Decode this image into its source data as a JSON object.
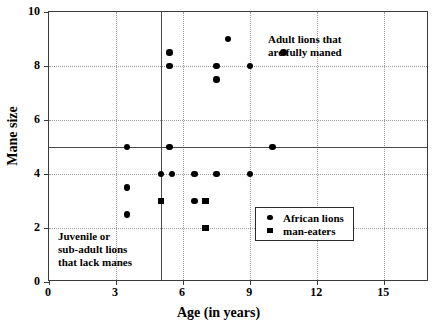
{
  "chart_data": {
    "type": "scatter",
    "title": "",
    "xlabel": "Age (in years)",
    "ylabel": "Mane size",
    "xlim": [
      0,
      17
    ],
    "ylim": [
      0,
      10
    ],
    "grid": true,
    "xticks": [
      0,
      3,
      6,
      9,
      12,
      15
    ],
    "yticks": [
      0,
      2,
      4,
      6,
      8,
      10
    ],
    "xticklabels": [
      "0",
      "3",
      "6",
      "9",
      "12",
      "15"
    ],
    "yticklabels": [
      "0",
      "2",
      "4",
      "6",
      "8",
      "10"
    ],
    "legend_position": "lower right",
    "reference_lines": [
      {
        "axis": "y",
        "value": 5
      },
      {
        "axis": "x",
        "value": 5
      }
    ],
    "series": [
      {
        "name": "African lions",
        "marker": "circle",
        "color": "#000000",
        "points": [
          {
            "x": 3.5,
            "y": 5.0
          },
          {
            "x": 3.5,
            "y": 3.5
          },
          {
            "x": 3.5,
            "y": 2.5
          },
          {
            "x": 5.0,
            "y": 4.0
          },
          {
            "x": 5.4,
            "y": 8.5
          },
          {
            "x": 5.4,
            "y": 8.0
          },
          {
            "x": 5.4,
            "y": 5.0
          },
          {
            "x": 5.5,
            "y": 4.0
          },
          {
            "x": 6.5,
            "y": 4.0
          },
          {
            "x": 6.5,
            "y": 3.0
          },
          {
            "x": 7.5,
            "y": 8.0
          },
          {
            "x": 7.5,
            "y": 7.5
          },
          {
            "x": 7.5,
            "y": 4.0
          },
          {
            "x": 8.0,
            "y": 9.0
          },
          {
            "x": 9.0,
            "y": 8.0
          },
          {
            "x": 9.0,
            "y": 4.0
          },
          {
            "x": 10.0,
            "y": 5.0
          },
          {
            "x": 10.5,
            "y": 8.5
          }
        ]
      },
      {
        "name": "man-eaters",
        "marker": "square",
        "color": "#000000",
        "points": [
          {
            "x": 5.0,
            "y": 3.0
          },
          {
            "x": 7.0,
            "y": 3.0
          },
          {
            "x": 7.0,
            "y": 2.0
          }
        ]
      }
    ],
    "annotations": [
      {
        "id": "adult",
        "text": "Adult lions that\nare fully maned",
        "x": 12.0,
        "y": 8.8
      },
      {
        "id": "juvenile",
        "text": "Juvenile or\nsub-adult lions\nthat lack manes",
        "x": 0.5,
        "y": 1.9
      }
    ]
  },
  "legend": {
    "entries": [
      {
        "label": "African lions",
        "marker": "circle"
      },
      {
        "label": "man-eaters",
        "marker": "square"
      }
    ]
  },
  "annotations": {
    "adult": "Adult lions that\nare fully maned",
    "juvenile": "Juvenile or\nsub-adult lions\nthat lack manes"
  },
  "axes": {
    "xlabel": "Age (in years)",
    "ylabel": "Mane size"
  }
}
